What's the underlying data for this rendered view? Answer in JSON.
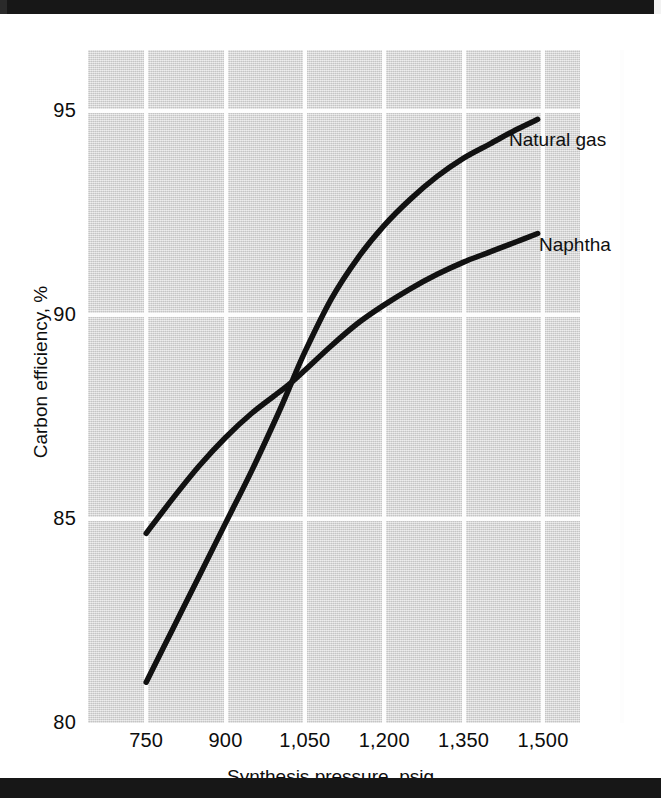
{
  "chart_data": {
    "type": "line",
    "title": "",
    "xlabel": "Synthesis pressure, psig",
    "ylabel": "Carbon efficiency, %",
    "xlim": [
      640,
      1570
    ],
    "ylim": [
      80,
      96.5
    ],
    "xticks": [
      750,
      900,
      1050,
      1200,
      1350,
      1500
    ],
    "xtick_labels": [
      "750",
      "900",
      "1,050",
      "1,200",
      "1,350",
      "1,500"
    ],
    "yticks": [
      80,
      85,
      90,
      95
    ],
    "ytick_labels": [
      "80",
      "85",
      "90",
      "95"
    ],
    "grid": true,
    "legend_position": "inline-right",
    "series": [
      {
        "name": "Natural gas",
        "label": "Natural gas",
        "color": "#111111",
        "x": [
          750,
          800,
          850,
          900,
          950,
          1000,
          1020,
          1050,
          1100,
          1150,
          1200,
          1250,
          1300,
          1350,
          1400,
          1450,
          1490
        ],
        "y": [
          81.0,
          82.3,
          83.6,
          84.9,
          86.2,
          87.6,
          88.2,
          89.1,
          90.4,
          91.4,
          92.2,
          92.85,
          93.4,
          93.85,
          94.2,
          94.55,
          94.8
        ]
      },
      {
        "name": "Naphtha",
        "label": "Naphtha",
        "color": "#111111",
        "x": [
          750,
          800,
          850,
          900,
          950,
          1000,
          1020,
          1050,
          1100,
          1150,
          1200,
          1250,
          1300,
          1350,
          1400,
          1450,
          1490
        ],
        "y": [
          84.65,
          85.5,
          86.3,
          87.0,
          87.6,
          88.1,
          88.3,
          88.65,
          89.25,
          89.8,
          90.25,
          90.65,
          91.0,
          91.3,
          91.55,
          91.8,
          92.0
        ]
      }
    ]
  },
  "axes": {
    "x_title": "Synthesis pressure, psig",
    "y_title": "Carbon efficiency, %"
  },
  "labels": {
    "natural_gas": "Natural gas",
    "naphtha": "Naphtha"
  },
  "colors": {
    "curve": "#111111",
    "plot_background": "#d8d8d8",
    "gridline": "#fdfdfd",
    "page_background": "#ffffff",
    "text": "#0d0d0d"
  }
}
